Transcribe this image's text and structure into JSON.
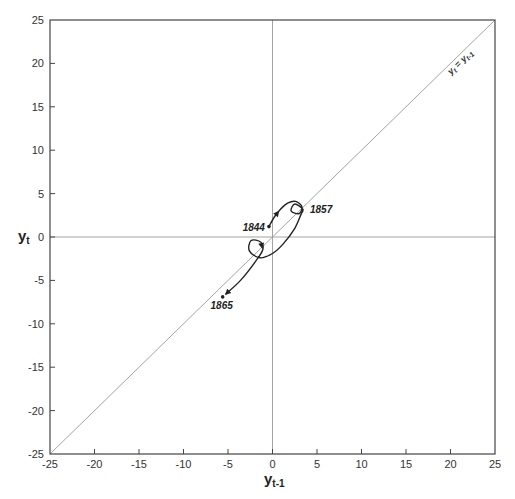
{
  "chart_data": {
    "type": "line",
    "title": "",
    "xlabel": "y_{t-1}",
    "ylabel": "y_t",
    "xlabel_main": "y",
    "xlabel_sub": "t-1",
    "ylabel_main": "y",
    "ylabel_sub": "t",
    "xlim": [
      -25,
      25
    ],
    "ylim": [
      -25,
      25
    ],
    "x_ticks": [
      -25,
      -20,
      -15,
      -10,
      -5,
      0,
      5,
      10,
      15,
      20,
      25
    ],
    "y_ticks": [
      -25,
      -20,
      -15,
      -10,
      -5,
      0,
      5,
      10,
      15,
      20,
      25
    ],
    "grid": false,
    "reference_lines": [
      {
        "type": "diagonal",
        "label": "y_t = y_{t-1}",
        "label_main": "yt = yt-1"
      },
      {
        "type": "horizontal",
        "at": 0
      },
      {
        "type": "vertical",
        "at": 0
      }
    ],
    "series": [
      {
        "name": "phase trajectory",
        "points": [
          {
            "x": -0.4,
            "y": 1.2
          },
          {
            "x": 0.2,
            "y": 2.3
          },
          {
            "x": 0.9,
            "y": 3.2
          },
          {
            "x": 1.7,
            "y": 3.9
          },
          {
            "x": 2.6,
            "y": 4.1
          },
          {
            "x": 3.3,
            "y": 3.5
          },
          {
            "x": 3.0,
            "y": 2.7
          },
          {
            "x": 2.1,
            "y": 3.0
          },
          {
            "x": 2.5,
            "y": 3.8
          },
          {
            "x": 3.4,
            "y": 3.2
          },
          {
            "x": 3.2,
            "y": 2.6
          },
          {
            "x": 2.5,
            "y": 1.0
          },
          {
            "x": 1.2,
            "y": -0.8
          },
          {
            "x": 0.0,
            "y": -1.9
          },
          {
            "x": -1.4,
            "y": -2.4
          },
          {
            "x": -2.6,
            "y": -1.6
          },
          {
            "x": -2.4,
            "y": -0.4
          },
          {
            "x": -1.3,
            "y": -0.6
          },
          {
            "x": -1.1,
            "y": -1.5
          },
          {
            "x": -1.9,
            "y": -2.8
          },
          {
            "x": -3.6,
            "y": -5.0
          },
          {
            "x": -5.6,
            "y": -6.9
          }
        ]
      }
    ],
    "annotations": [
      {
        "text": "1844",
        "x": -0.4,
        "y": 1.2,
        "note": "start point"
      },
      {
        "text": "1857",
        "x": 3.2,
        "y": 3.0
      },
      {
        "text": "1865",
        "x": -5.6,
        "y": -6.9,
        "note": "end point"
      }
    ]
  }
}
